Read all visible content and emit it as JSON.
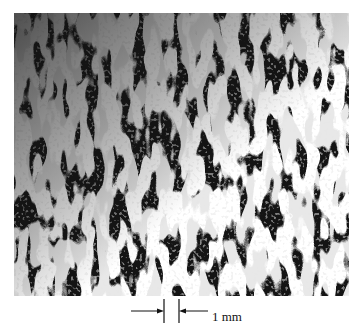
{
  "figure": {
    "background_color": "#141414",
    "stripe_color": "#f2f2f2"
  },
  "scale_bar": {
    "label": "1 mm"
  }
}
